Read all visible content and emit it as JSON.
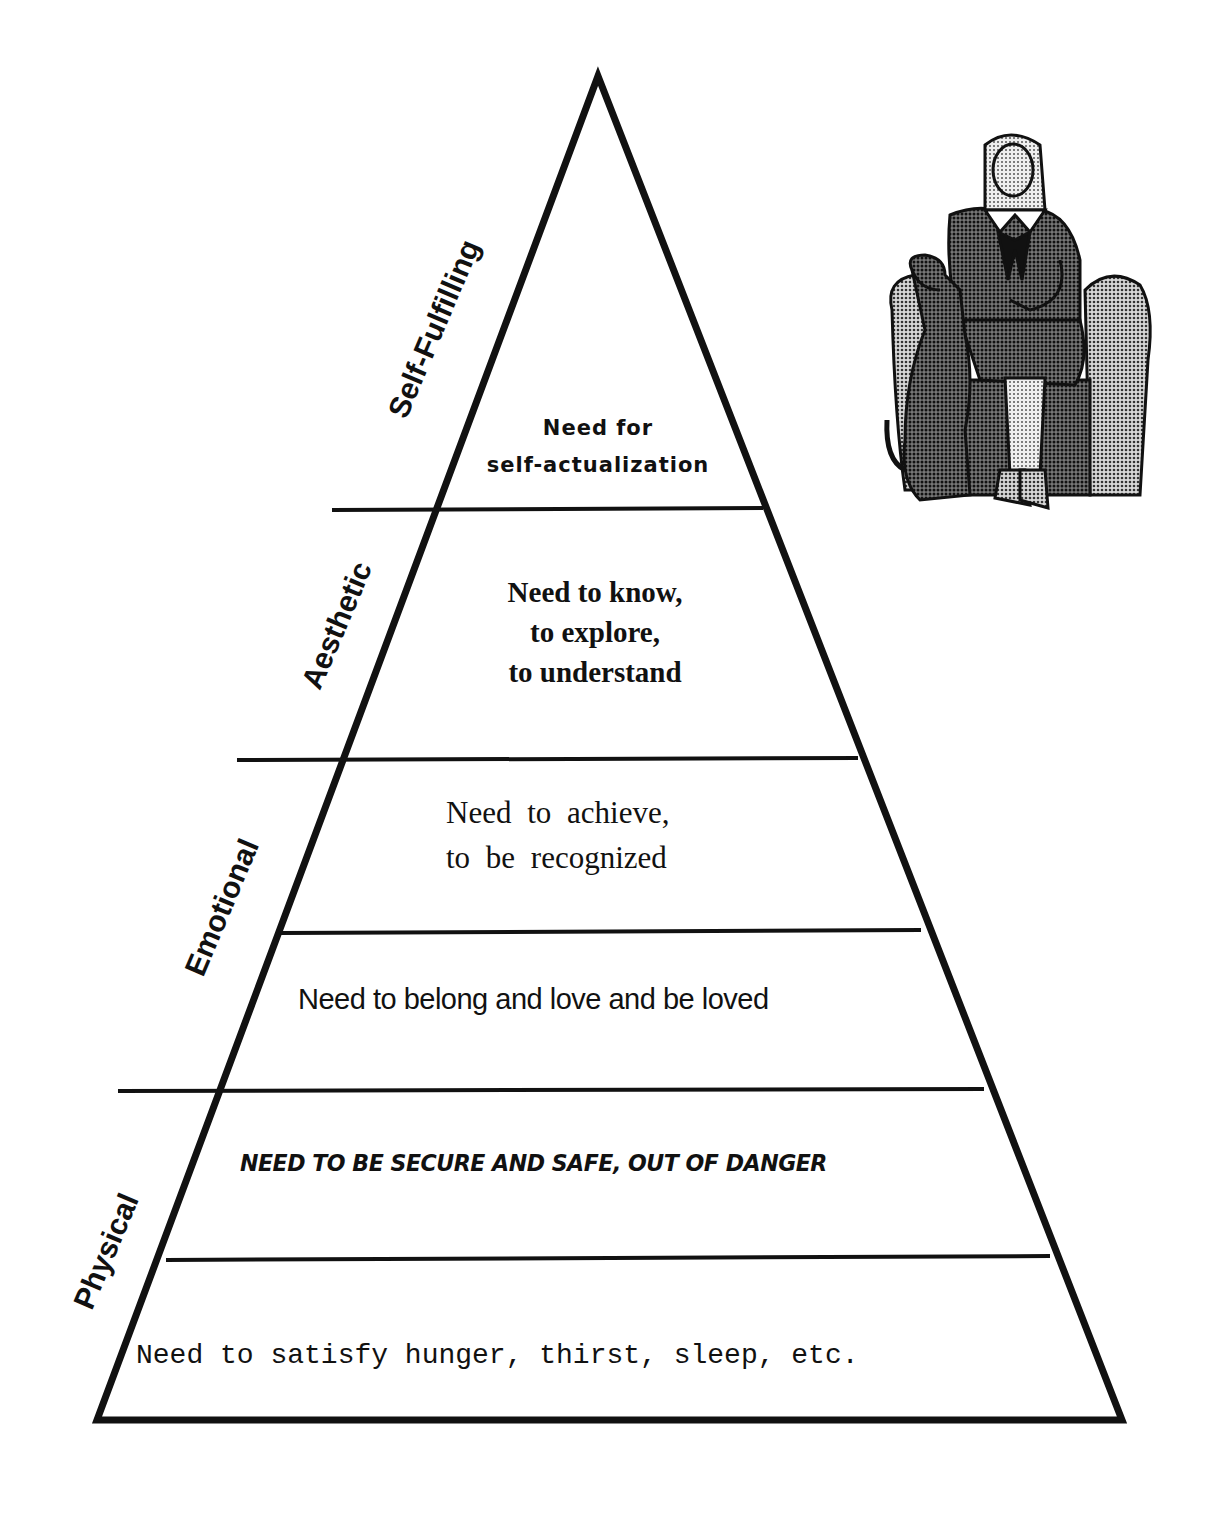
{
  "diagram": {
    "type": "hierarchy-pyramid",
    "tiers": [
      {
        "level": 1,
        "text": "Need to satisfy hunger, thirst, sleep, etc."
      },
      {
        "level": 2,
        "text": "NEED TO BE SECURE AND SAFE, OUT OF DANGER"
      },
      {
        "level": 3,
        "text": "Need to belong and love and be loved"
      },
      {
        "level": 4,
        "lines": [
          "Need to achieve,",
          "to be recognized"
        ]
      },
      {
        "level": 5,
        "lines": [
          "Need to know,",
          "to explore,",
          "to understand"
        ]
      },
      {
        "level": 6,
        "lines": [
          "Need for",
          "self-actualization"
        ]
      }
    ],
    "categories": [
      {
        "label": "Physical",
        "spans_levels": [
          1,
          2
        ]
      },
      {
        "label": "Emotional",
        "spans_levels": [
          3,
          4
        ]
      },
      {
        "label": "Aesthetic",
        "spans_levels": [
          5
        ]
      },
      {
        "label": "Self-Fulfilling",
        "spans_levels": [
          6
        ]
      }
    ],
    "illustration": "woman-seated-in-armchair-with-dog",
    "colors": {
      "line": "#111111",
      "background": "#ffffff",
      "halftone": "#6a6a6a"
    }
  }
}
